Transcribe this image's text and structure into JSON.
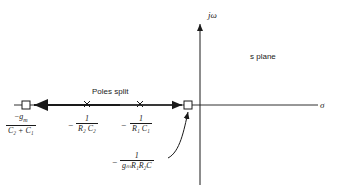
{
  "diagram": {
    "axes": {
      "vertical_label": "jω",
      "horizontal_label": "σ",
      "plane_label": "s plane"
    },
    "annotation": "Poles split",
    "points": [
      {
        "kind": "closed-loop pole (square)",
        "label_num": "−g_m",
        "label_num_text": "g",
        "label_num_sub": "m",
        "label_den": "C₂ + C₁"
      },
      {
        "kind": "open-loop pole (x)",
        "label_sign": "−",
        "label_num": "1",
        "label_den": "R₂ C₂"
      },
      {
        "kind": "open-loop pole (x)",
        "label_sign": "−",
        "label_num": "1",
        "label_den": "R₁ C₁"
      },
      {
        "kind": "closed-loop pole (square)",
        "label_sign": "−",
        "label_num": "1",
        "label_den": "gₘR₁R₂C"
      }
    ]
  }
}
